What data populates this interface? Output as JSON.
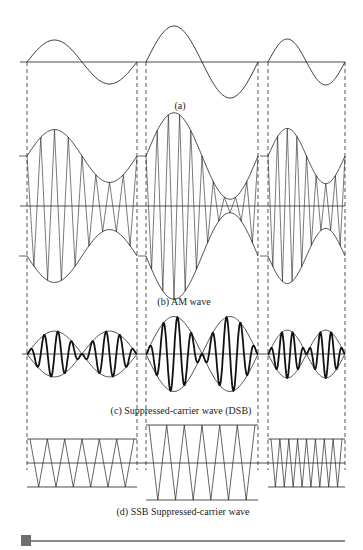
{
  "figure": {
    "captions": {
      "a": "(a)",
      "b": "(b) AM wave",
      "c": "(c) Suppressed-carrier wave (DSB)",
      "d": "(d) SSB Suppressed-carrier wave"
    },
    "segments": [
      {
        "x0": 27,
        "x1": 137,
        "mod_amplitude": 22,
        "mod_sign": 1
      },
      {
        "x0": 146,
        "x1": 258,
        "mod_amplitude": 36,
        "mod_sign": 1
      },
      {
        "x0": 268,
        "x1": 345,
        "mod_amplitude": 23,
        "mod_sign": 1
      }
    ],
    "dashed_guides_x": [
      27,
      137,
      146,
      258,
      268,
      345
    ],
    "panel_a": {
      "axis_y": 62,
      "axis_x0": 20,
      "axis_x1": 345
    },
    "panel_b": {
      "axis_y": 206,
      "axis_x0": 20,
      "axis_x1": 345,
      "carrier_level": 50,
      "mod_scale": 1.6,
      "carrier_cycles": [
        8,
        10,
        8
      ]
    },
    "panel_c": {
      "axis_y": 354,
      "axis_x0": 22,
      "axis_x1": 345,
      "scale": 1.6,
      "carrier_cycles": [
        8,
        8,
        7
      ]
    },
    "panel_d": {
      "center_y": 463,
      "boxes": [
        {
          "x0": 27,
          "x1": 137,
          "top": 439,
          "bottom": 487,
          "cycles": 6
        },
        {
          "x0": 146,
          "x1": 258,
          "top": 425,
          "bottom": 500,
          "cycles": 6
        },
        {
          "x0": 268,
          "x1": 345,
          "top": 439,
          "bottom": 487,
          "cycles": 8
        }
      ]
    },
    "caption_positions": {
      "a": {
        "x": 180,
        "y": 100
      },
      "b": {
        "x": 184,
        "y": 296
      },
      "c": {
        "x": 181,
        "y": 405
      },
      "d": {
        "x": 183,
        "y": 506
      }
    },
    "colors": {
      "line": "#222222",
      "dash": "#444444",
      "footer": "#777777"
    }
  }
}
